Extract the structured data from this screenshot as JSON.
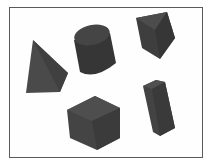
{
  "image": {
    "description": "Five dark gray 3D geometric solids on white background inside a thin border frame",
    "background_color": "#ffffff",
    "frame_color": "#5a5a5a",
    "shapes": [
      {
        "name": "pyramid",
        "color": "#4a4a4a",
        "shade": "#3a3a3a"
      },
      {
        "name": "cylinder",
        "color": "#3c3c3c",
        "shade": "#2e2e2e"
      },
      {
        "name": "triangular-prism",
        "color": "#444444",
        "shade": "#353535"
      },
      {
        "name": "cube",
        "color": "#484848",
        "shade": "#3a3a3a"
      },
      {
        "name": "rectangular-prism",
        "color": "#474747",
        "shade": "#383838"
      }
    ]
  }
}
